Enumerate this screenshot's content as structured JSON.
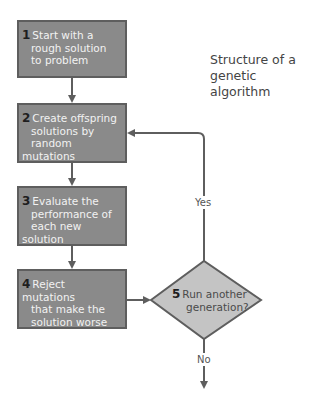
{
  "title": "Structure of a genetic algorithm",
  "title_lines": [
    "Structure of a",
    "genetic algorithm"
  ],
  "steps": [
    {
      "num": "1",
      "text": "Start with a rough solution to problem",
      "lines": [
        "Start with a",
        "rough solution",
        "to problem"
      ]
    },
    {
      "num": "2",
      "text": "Create offspring solutions by random mutations",
      "lines": [
        "Create offspring",
        "solutions by",
        "random mutations"
      ]
    },
    {
      "num": "3",
      "text": "Evaluate the performance of each new solution",
      "lines": [
        "Evaluate the",
        "performance of",
        "each new solution"
      ]
    },
    {
      "num": "4",
      "text": "Reject mutations that make the solution worse",
      "lines": [
        "Reject mutations",
        "that make the",
        "solution worse"
      ]
    }
  ],
  "decision": {
    "num": "5",
    "text": "Run another generation?",
    "lines": [
      "Run another",
      "generation?"
    ]
  },
  "edges": {
    "yes_label": "Yes",
    "no_label": "No"
  },
  "colors": {
    "box_fill": "#8a8a8a",
    "box_border": "#5e5e5e",
    "diamond_fill": "#c4c4c4",
    "line": "#5e5e5e"
  }
}
